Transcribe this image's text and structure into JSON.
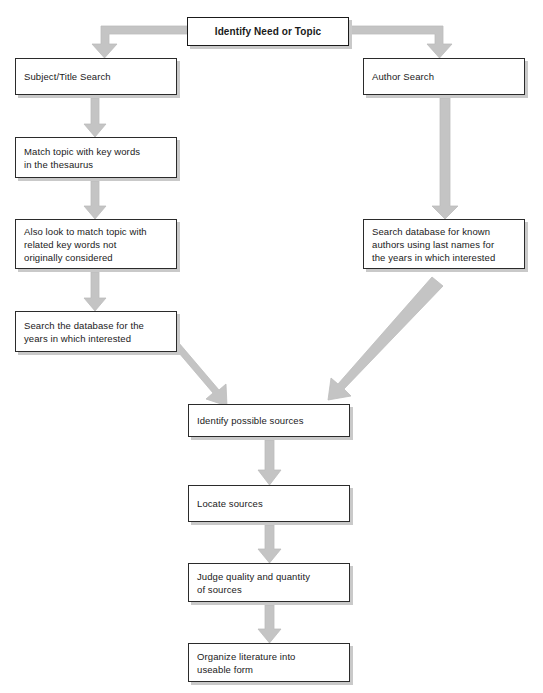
{
  "diagram": {
    "colors": {
      "box_fill": "#ffffff",
      "box_border": "#2b2b2b",
      "box_shadow": "#c9c9c9",
      "arrow_fill": "#c0c0c0",
      "arrow_stroke": "#b0b0b0",
      "text": "#1a1a1a"
    },
    "nodes": [
      {
        "id": "identify-need-or-topic",
        "text": "Identify Need or Topic",
        "x": 187,
        "y": 17,
        "w": 162,
        "h": 29,
        "bold": true
      },
      {
        "id": "subject-title-search",
        "text": "Subject/Title Search",
        "x": 15,
        "y": 58,
        "w": 162,
        "h": 37,
        "bold": false
      },
      {
        "id": "author-search",
        "text": "Author Search",
        "x": 363,
        "y": 58,
        "w": 162,
        "h": 37,
        "bold": false
      },
      {
        "id": "match-topic-key-words",
        "text": "Match topic with key words\nin the thesaurus",
        "x": 15,
        "y": 137,
        "w": 162,
        "h": 41,
        "bold": false
      },
      {
        "id": "also-look-related-key-words",
        "text": "Also look to match topic with\nrelated key words not\noriginally considered",
        "x": 15,
        "y": 219,
        "w": 162,
        "h": 50,
        "bold": false
      },
      {
        "id": "search-database-known-authors",
        "text": "Search database for known\nauthors using last names for\nthe years in which interested",
        "x": 363,
        "y": 219,
        "w": 162,
        "h": 50,
        "bold": false
      },
      {
        "id": "search-database-years",
        "text": "Search the database for the\nyears in which interested",
        "x": 15,
        "y": 311,
        "w": 162,
        "h": 41,
        "bold": false
      },
      {
        "id": "identify-possible-sources",
        "text": "Identify possible sources",
        "x": 188,
        "y": 404,
        "w": 162,
        "h": 33,
        "bold": false
      },
      {
        "id": "locate-sources",
        "text": "Locate sources",
        "x": 188,
        "y": 485,
        "w": 162,
        "h": 37,
        "bold": false
      },
      {
        "id": "judge-quality-quantity",
        "text": "Judge quality and quantity\nof sources",
        "x": 188,
        "y": 563,
        "w": 162,
        "h": 39,
        "bold": false
      },
      {
        "id": "organize-literature",
        "text": "Organize literature into\nuseable form",
        "x": 188,
        "y": 643,
        "w": 162,
        "h": 39,
        "bold": false
      }
    ],
    "connectors": [
      {
        "id": "arrow-topic-to-subject-title",
        "type": "elbow-left",
        "from": "identify-need-or-topic",
        "to": "subject-title-search"
      },
      {
        "id": "arrow-topic-to-author",
        "type": "elbow-right",
        "from": "identify-need-or-topic",
        "to": "author-search"
      },
      {
        "id": "arrow-subject-to-match",
        "type": "vertical",
        "from": "subject-title-search",
        "to": "match-topic-key-words"
      },
      {
        "id": "arrow-match-to-also-look",
        "type": "vertical",
        "from": "match-topic-key-words",
        "to": "also-look-related-key-words"
      },
      {
        "id": "arrow-also-look-to-search-years",
        "type": "vertical",
        "from": "also-look-related-key-words",
        "to": "search-database-years"
      },
      {
        "id": "arrow-author-to-search-known",
        "type": "vertical-long",
        "from": "author-search",
        "to": "search-database-known-authors"
      },
      {
        "id": "arrow-search-years-to-identify-sources",
        "type": "diagonal-right-down",
        "from": "search-database-years",
        "to": "identify-possible-sources"
      },
      {
        "id": "arrow-search-known-to-identify-sources",
        "type": "diagonal-left-down",
        "from": "search-database-known-authors",
        "to": "identify-possible-sources"
      },
      {
        "id": "arrow-identify-to-locate",
        "type": "vertical",
        "from": "identify-possible-sources",
        "to": "locate-sources"
      },
      {
        "id": "arrow-locate-to-judge",
        "type": "vertical",
        "from": "locate-sources",
        "to": "judge-quality-quantity"
      },
      {
        "id": "arrow-judge-to-organize",
        "type": "vertical",
        "from": "judge-quality-quantity",
        "to": "organize-literature"
      }
    ]
  }
}
